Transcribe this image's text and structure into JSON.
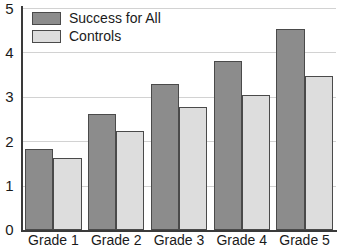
{
  "chart_data": {
    "type": "bar",
    "title": "",
    "subtitle": "",
    "xlabel": "",
    "ylabel": "",
    "categories": [
      "Grade 1",
      "Grade 2",
      "Grade 3",
      "Grade 4",
      "Grade 5"
    ],
    "series": [
      {
        "name": "Success for All",
        "color": "#8c8c8c",
        "values": [
          1.83,
          2.62,
          3.28,
          3.8,
          4.52
        ]
      },
      {
        "name": "Controls",
        "color": "#dddddd",
        "values": [
          1.63,
          2.24,
          2.78,
          3.03,
          3.48
        ]
      }
    ],
    "ylim": [
      0,
      5
    ],
    "y_ticks": [
      0,
      1,
      2,
      3,
      4,
      5
    ],
    "y_tick_labels": [
      "0",
      "1",
      "2",
      "3",
      "4",
      "5"
    ],
    "grid": "horizontal",
    "legend_position": "top-left",
    "annotations": []
  },
  "legend": {
    "items": [
      {
        "label": "Success for All",
        "swatch": "dark-gray-swatch"
      },
      {
        "label": "Controls",
        "swatch": "light-gray-swatch"
      }
    ]
  },
  "axes": {
    "y_labels": [
      "5",
      "4",
      "3",
      "2",
      "1",
      "0"
    ],
    "x_labels": [
      "Grade 1",
      "Grade 2",
      "Grade 3",
      "Grade 4",
      "Grade 5"
    ]
  }
}
